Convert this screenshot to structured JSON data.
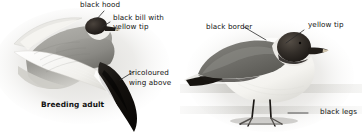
{
  "plate": {
    "subject": "Sabine's Gull field-guide plate",
    "background_color": "#ffffff",
    "ink_color": "#111111",
    "width": 364,
    "height": 138
  },
  "figures": [
    {
      "id": "flying-gull",
      "name": "breeding-adult-in-flight",
      "caption": "Breeding adult",
      "palette": {
        "hood": "#2a2522",
        "bill_tip": "#c9bda6",
        "upperwing_gray": "#8e8d88",
        "wing_black": "#16130f",
        "wing_white": "#f4f3ef",
        "shadow": "#b9b8b3"
      }
    },
    {
      "id": "standing-gull",
      "name": "standing-adult",
      "caption": "",
      "palette": {
        "hood": "#35302b",
        "mantle_gray": "#6f6e69",
        "body_white": "#f6f5f1",
        "legs": "#1b1815",
        "bill_tip": "#cfc4ad",
        "ground": "#c6c5c0"
      }
    }
  ],
  "annotations": [
    {
      "id": "black-hood",
      "text": "black hood",
      "figure": "flying-gull",
      "align": "left"
    },
    {
      "id": "black-bill",
      "text": "black bill with",
      "figure": "flying-gull",
      "align": "left"
    },
    {
      "id": "yellow-tip-left",
      "text": "yellow tip",
      "figure": "flying-gull",
      "align": "left"
    },
    {
      "id": "tricoloured",
      "text": "tricoloured",
      "figure": "flying-gull",
      "align": "left"
    },
    {
      "id": "wing-above",
      "text": "wing above",
      "figure": "flying-gull",
      "align": "left"
    },
    {
      "id": "breeding-adult",
      "text": "Breeding adult",
      "figure": "flying-gull",
      "align": "left"
    },
    {
      "id": "black-border",
      "text": "black border",
      "figure": "standing-gull",
      "align": "left"
    },
    {
      "id": "yellow-tip-right",
      "text": "yellow tip",
      "figure": "standing-gull",
      "align": "left"
    },
    {
      "id": "black-legs",
      "text": "black legs",
      "figure": "standing-gull",
      "align": "left"
    }
  ]
}
